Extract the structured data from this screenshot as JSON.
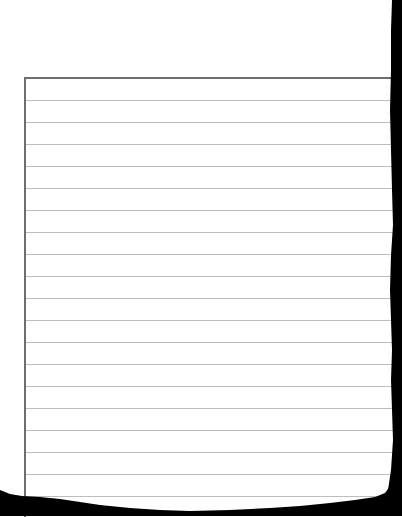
{
  "document": {
    "type": "ruled-paper-scan",
    "paper_color": "#ffffff",
    "border_color": "#6e6e6e",
    "rule_color": "#bdbdbd",
    "edge_color": "#000000",
    "ruled_area": {
      "left": 24,
      "top": 77,
      "line_spacing": 22,
      "first_line": 100,
      "line_count": 19
    },
    "text": ""
  }
}
